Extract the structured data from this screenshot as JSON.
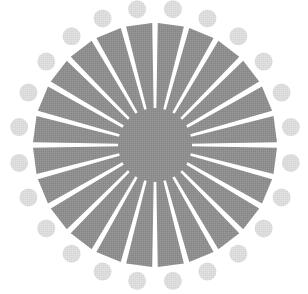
{
  "artwork": {
    "name": "radial-sunburst-emblem",
    "kind": "logo",
    "background_color": "#ffffff",
    "canvas": {
      "width": 308,
      "height": 294
    },
    "center": {
      "x": 155,
      "y": 145
    },
    "texture": "halftone-dither"
  },
  "hub": {
    "name": "center-disc",
    "shape": "circle",
    "radius": 37,
    "color": "#8f8f8f"
  },
  "rays": {
    "name": "sunburst-rays",
    "count": 24,
    "color": "#8f8f8f",
    "angle_step_deg": 15,
    "start_angle_deg": -97.5,
    "inner_radius": 36,
    "outer_radius": 122,
    "inner_half_width_deg": 5.4,
    "outer_half_width_deg": 6.2
  },
  "dot_ring": {
    "name": "outer-dot-ring",
    "count": 24,
    "color": "#dcdcdc",
    "ring_radius": 137,
    "dot_radius": 9,
    "angle_step_deg": 15,
    "start_angle_deg": -97.5
  },
  "chart_data": {
    "type": "pie",
    "title": "",
    "categories": [
      "ray-01",
      "ray-02",
      "ray-03",
      "ray-04",
      "ray-05",
      "ray-06",
      "ray-07",
      "ray-08",
      "ray-09",
      "ray-10",
      "ray-11",
      "ray-12",
      "ray-13",
      "ray-14",
      "ray-15",
      "ray-16",
      "ray-17",
      "ray-18",
      "ray-19",
      "ray-20",
      "ray-21",
      "ray-22",
      "ray-23",
      "ray-24"
    ],
    "values": [
      15,
      15,
      15,
      15,
      15,
      15,
      15,
      15,
      15,
      15,
      15,
      15,
      15,
      15,
      15,
      15,
      15,
      15,
      15,
      15,
      15,
      15,
      15,
      15
    ],
    "xlabel": "",
    "ylabel": "",
    "legend": [],
    "grid": false
  }
}
